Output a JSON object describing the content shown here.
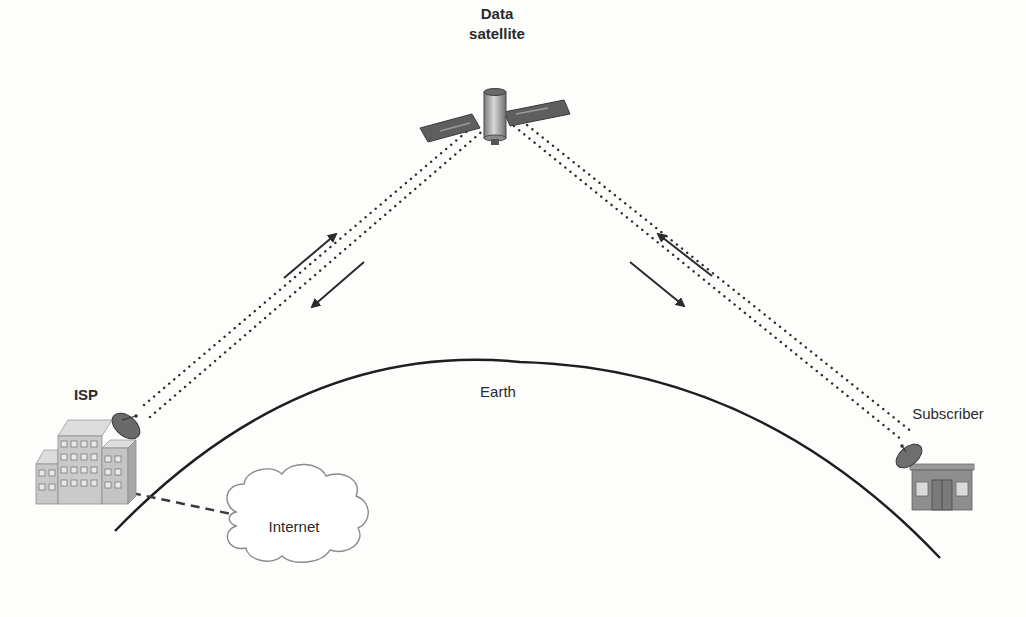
{
  "diagram": {
    "type": "satellite-internet-schematic",
    "nodes": {
      "satellite": {
        "label_line1": "Data",
        "label_line2": "satellite",
        "icon": "satellite-icon"
      },
      "earth": {
        "label": "Earth"
      },
      "isp": {
        "label": "ISP",
        "icon": "building-with-dish-icon"
      },
      "internet": {
        "label": "Internet",
        "icon": "cloud-icon"
      },
      "subscriber": {
        "label": "Subscriber",
        "icon": "house-with-dish-icon"
      }
    },
    "links": [
      {
        "from": "isp",
        "to": "satellite",
        "style": "dotted-double",
        "arrows": [
          "up",
          "down"
        ]
      },
      {
        "from": "satellite",
        "to": "subscriber",
        "style": "dotted-double",
        "arrows": [
          "down",
          "up"
        ]
      },
      {
        "from": "isp",
        "to": "internet",
        "style": "dashed"
      }
    ],
    "colors": {
      "line": "#2b2b2b",
      "building": "#c9c9c9",
      "panel": "#5a5a5a",
      "cloud_stroke": "#8a8a8a"
    }
  }
}
